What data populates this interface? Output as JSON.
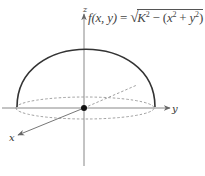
{
  "diagram": {
    "formula": {
      "lhs": "f(x, y)",
      "equals": "=",
      "radical": "√",
      "K": "K",
      "minus": " − (x",
      "plus": " + y",
      "close": ")",
      "exp2": "2",
      "full_text": "f(x, y) = √(K² − (x² + y²))"
    },
    "axes": {
      "x_label": "x",
      "y_label": "y",
      "z_label": "z"
    },
    "colors": {
      "axis": "#777777",
      "curve": "#333333",
      "dashed": "#888888",
      "origin": "#111111"
    }
  }
}
